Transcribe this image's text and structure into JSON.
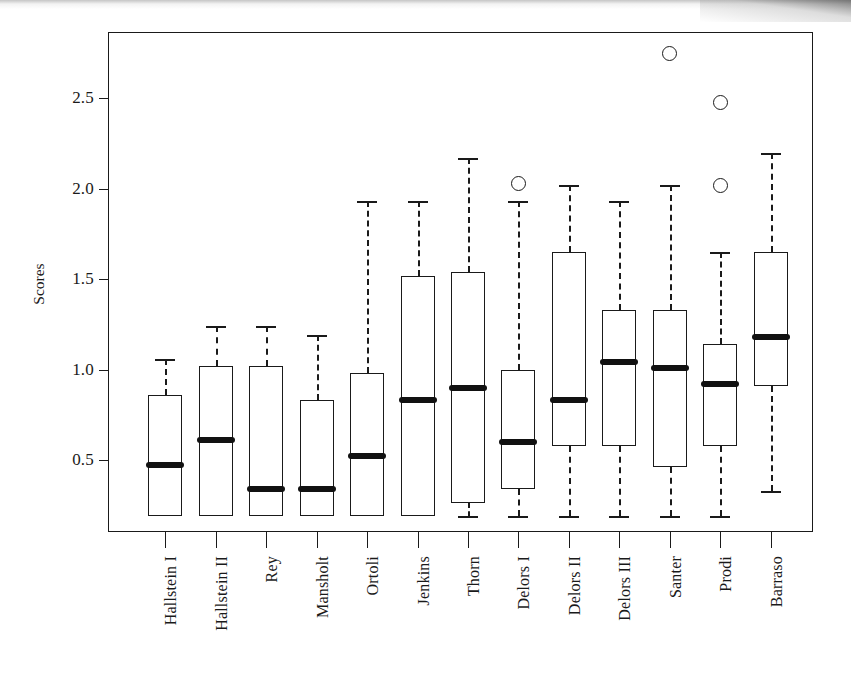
{
  "chart_data": {
    "type": "box",
    "title": "",
    "xlabel": "",
    "ylabel": "Scores",
    "ylim": [
      0.1,
      2.86
    ],
    "yticks": [
      0.5,
      1.0,
      1.5,
      2.0,
      2.5
    ],
    "ytick_labels": [
      "0.5",
      "1.0",
      "1.5",
      "2.0",
      "2.5"
    ],
    "grid": false,
    "legend": "none",
    "categories": [
      "Hallstein I",
      "Hallstein II",
      "Rey",
      "Mansholt",
      "Ortoli",
      "Jenkins",
      "Thorn",
      "Delors I",
      "Delors II",
      "Delors III",
      "Santer",
      "Prodi",
      "Barraso"
    ],
    "boxes": [
      {
        "label": "Hallstein I",
        "whisker_low": 0.19,
        "q1": 0.19,
        "median": 0.47,
        "q3": 0.86,
        "whisker_high": 1.06,
        "outliers": []
      },
      {
        "label": "Hallstein II",
        "whisker_low": 0.19,
        "q1": 0.19,
        "median": 0.61,
        "q3": 1.02,
        "whisker_high": 1.24,
        "outliers": []
      },
      {
        "label": "Rey",
        "whisker_low": 0.19,
        "q1": 0.19,
        "median": 0.34,
        "q3": 1.02,
        "whisker_high": 1.24,
        "outliers": []
      },
      {
        "label": "Mansholt",
        "whisker_low": 0.19,
        "q1": 0.19,
        "median": 0.34,
        "q3": 0.83,
        "whisker_high": 1.19,
        "outliers": []
      },
      {
        "label": "Ortoli",
        "whisker_low": 0.19,
        "q1": 0.19,
        "median": 0.52,
        "q3": 0.98,
        "whisker_high": 1.93,
        "outliers": []
      },
      {
        "label": "Jenkins",
        "whisker_low": 0.19,
        "q1": 0.19,
        "median": 0.83,
        "q3": 1.52,
        "whisker_high": 1.93,
        "outliers": []
      },
      {
        "label": "Thorn",
        "whisker_low": 0.19,
        "q1": 0.26,
        "median": 0.9,
        "q3": 1.54,
        "whisker_high": 2.17,
        "outliers": []
      },
      {
        "label": "Delors I",
        "whisker_low": 0.19,
        "q1": 0.34,
        "median": 0.6,
        "q3": 1.0,
        "whisker_high": 1.93,
        "outliers": [
          2.03
        ]
      },
      {
        "label": "Delors II",
        "whisker_low": 0.19,
        "q1": 0.58,
        "median": 0.83,
        "q3": 1.65,
        "whisker_high": 2.02,
        "outliers": []
      },
      {
        "label": "Delors III",
        "whisker_low": 0.19,
        "q1": 0.58,
        "median": 1.04,
        "q3": 1.33,
        "whisker_high": 1.93,
        "outliers": []
      },
      {
        "label": "Santer",
        "whisker_low": 0.19,
        "q1": 0.46,
        "median": 1.01,
        "q3": 1.33,
        "whisker_high": 2.02,
        "outliers": [
          2.75
        ]
      },
      {
        "label": "Prodi",
        "whisker_low": 0.19,
        "q1": 0.58,
        "median": 0.92,
        "q3": 1.14,
        "whisker_high": 1.65,
        "outliers": [
          2.48,
          2.02
        ]
      },
      {
        "label": "Barraso",
        "whisker_low": 0.33,
        "q1": 0.91,
        "median": 1.18,
        "q3": 1.65,
        "whisker_high": 2.2,
        "outliers": []
      }
    ],
    "colors": {
      "line": "#1a1a1a",
      "box_fill": "#ffffff",
      "median": "#111111",
      "background": "#ffffff"
    }
  }
}
